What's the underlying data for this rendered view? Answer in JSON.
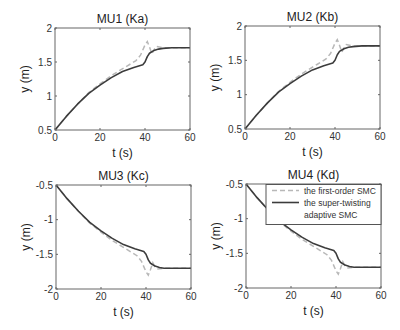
{
  "chart_data": [
    {
      "type": "line",
      "title": "MU1 (Ka)",
      "xlabel": "t (s)",
      "ylabel": "y (m)",
      "xlim": [
        0,
        60
      ],
      "ylim": [
        0.5,
        2
      ],
      "xticks": [
        0,
        20,
        40,
        60
      ],
      "xtick_labels": [
        "0",
        "20",
        "40",
        "60"
      ],
      "yticks": [
        0.5,
        1,
        1.5,
        2
      ],
      "ytick_labels": [
        "0.5",
        "1",
        "1.5",
        "2"
      ],
      "grid": false,
      "box": {
        "x0": 55,
        "y0": 28,
        "x1": 190,
        "y1": 130
      },
      "series": [
        {
          "name": "the first-order SMC",
          "style": "dashed",
          "x": [
            0,
            5,
            10,
            15,
            20,
            25,
            28,
            32,
            36,
            38,
            40,
            41,
            42,
            43,
            44,
            45,
            48,
            52,
            60
          ],
          "y": [
            0.5,
            0.7,
            0.88,
            1.05,
            1.18,
            1.3,
            1.36,
            1.44,
            1.52,
            1.6,
            1.75,
            1.8,
            1.72,
            1.62,
            1.68,
            1.73,
            1.71,
            1.71,
            1.71
          ]
        },
        {
          "name": "the super-twisting adaptive SMC",
          "style": "solid",
          "x": [
            0,
            5,
            10,
            15,
            20,
            25,
            30,
            35,
            39,
            40,
            41,
            42,
            44,
            46,
            48,
            52,
            60
          ],
          "y": [
            0.5,
            0.7,
            0.88,
            1.04,
            1.16,
            1.27,
            1.36,
            1.42,
            1.46,
            1.5,
            1.58,
            1.63,
            1.67,
            1.69,
            1.7,
            1.71,
            1.71
          ]
        }
      ]
    },
    {
      "type": "line",
      "title": "MU2 (Kb)",
      "xlabel": "t (s)",
      "ylabel": "y (m)",
      "xlim": [
        0,
        60
      ],
      "ylim": [
        0.5,
        2
      ],
      "xticks": [
        0,
        20,
        40,
        60
      ],
      "xtick_labels": [
        "0",
        "20",
        "40",
        "60"
      ],
      "yticks": [
        0.5,
        1,
        1.5,
        2
      ],
      "ytick_labels": [
        "0.5",
        "1",
        "1.5",
        "2"
      ],
      "grid": false,
      "box": {
        "x0": 245,
        "y0": 26,
        "x1": 380,
        "y1": 129
      },
      "series": [
        {
          "name": "the first-order SMC",
          "style": "dashed",
          "x": [
            0,
            5,
            10,
            15,
            20,
            25,
            28,
            32,
            36,
            38,
            40,
            41,
            42,
            43,
            44,
            45,
            48,
            52,
            60
          ],
          "y": [
            0.5,
            0.7,
            0.88,
            1.05,
            1.18,
            1.3,
            1.36,
            1.44,
            1.52,
            1.6,
            1.75,
            1.8,
            1.72,
            1.62,
            1.68,
            1.73,
            1.71,
            1.71,
            1.71
          ]
        },
        {
          "name": "the super-twisting adaptive SMC",
          "style": "solid",
          "x": [
            0,
            5,
            10,
            15,
            20,
            25,
            30,
            35,
            39,
            40,
            41,
            42,
            44,
            46,
            48,
            52,
            60
          ],
          "y": [
            0.5,
            0.7,
            0.88,
            1.04,
            1.16,
            1.27,
            1.36,
            1.42,
            1.46,
            1.5,
            1.58,
            1.63,
            1.67,
            1.69,
            1.7,
            1.71,
            1.71
          ]
        }
      ]
    },
    {
      "type": "line",
      "title": "MU3 (Kc)",
      "xlabel": "t (s)",
      "ylabel": "y (m)",
      "xlim": [
        0,
        60
      ],
      "ylim": [
        -2,
        -0.5
      ],
      "xticks": [
        0,
        20,
        40,
        60
      ],
      "xtick_labels": [
        "0",
        "20",
        "40",
        "60"
      ],
      "yticks": [
        -2,
        -1.5,
        -1,
        -0.5
      ],
      "ytick_labels": [
        "-2",
        "-1.5",
        "-1",
        "-0.5"
      ],
      "grid": false,
      "box": {
        "x0": 56,
        "y0": 185,
        "x1": 191,
        "y1": 289
      },
      "series": [
        {
          "name": "the first-order SMC",
          "style": "dashed",
          "x": [
            0,
            5,
            10,
            15,
            20,
            25,
            28,
            32,
            36,
            38,
            40,
            41,
            42,
            43,
            44,
            45,
            48,
            52,
            60
          ],
          "y": [
            -0.5,
            -0.7,
            -0.88,
            -1.05,
            -1.18,
            -1.3,
            -1.36,
            -1.44,
            -1.52,
            -1.6,
            -1.75,
            -1.8,
            -1.72,
            -1.62,
            -1.68,
            -1.71,
            -1.7,
            -1.7,
            -1.7
          ]
        },
        {
          "name": "the super-twisting adaptive SMC",
          "style": "solid",
          "x": [
            0,
            5,
            10,
            15,
            20,
            25,
            30,
            35,
            39,
            40,
            41,
            42,
            44,
            46,
            48,
            52,
            60
          ],
          "y": [
            -0.5,
            -0.7,
            -0.88,
            -1.04,
            -1.16,
            -1.27,
            -1.36,
            -1.42,
            -1.46,
            -1.5,
            -1.58,
            -1.63,
            -1.67,
            -1.69,
            -1.7,
            -1.7,
            -1.7
          ]
        }
      ]
    },
    {
      "type": "line",
      "title": "MU4 (Kd)",
      "xlabel": "t (s)",
      "ylabel": "y (m)",
      "xlim": [
        0,
        60
      ],
      "ylim": [
        -2,
        -0.5
      ],
      "xticks": [
        0,
        20,
        40,
        60
      ],
      "xtick_labels": [
        "0",
        "20",
        "40",
        "60"
      ],
      "yticks": [
        -2,
        -1.5,
        -1,
        -0.5
      ],
      "ytick_labels": [
        "-2",
        "-1.5",
        "-1",
        "-0.5"
      ],
      "grid": false,
      "box": {
        "x0": 246,
        "y0": 184,
        "x1": 381,
        "y1": 288
      },
      "legend": {
        "position": "upper right",
        "entries": [
          {
            "label_lines": [
              "the first-order SMC"
            ],
            "style": "dashed"
          },
          {
            "label_lines": [
              "the super-twisting",
              "adaptive SMC"
            ],
            "style": "solid"
          }
        ]
      },
      "series": [
        {
          "name": "the first-order SMC",
          "style": "dashed",
          "x": [
            0,
            5,
            10,
            15,
            20,
            25,
            28,
            32,
            36,
            38,
            40,
            41,
            42,
            43,
            44,
            45,
            48,
            52,
            60
          ],
          "y": [
            -0.5,
            -0.7,
            -0.88,
            -1.05,
            -1.18,
            -1.3,
            -1.36,
            -1.44,
            -1.52,
            -1.6,
            -1.75,
            -1.8,
            -1.72,
            -1.62,
            -1.68,
            -1.71,
            -1.7,
            -1.7,
            -1.7
          ]
        },
        {
          "name": "the super-twisting adaptive SMC",
          "style": "solid",
          "x": [
            0,
            5,
            10,
            15,
            20,
            25,
            30,
            35,
            39,
            40,
            41,
            42,
            44,
            46,
            48,
            52,
            60
          ],
          "y": [
            -0.5,
            -0.7,
            -0.88,
            -1.04,
            -1.16,
            -1.27,
            -1.36,
            -1.42,
            -1.46,
            -1.5,
            -1.58,
            -1.63,
            -1.67,
            -1.69,
            -1.7,
            -1.7,
            -1.7
          ]
        }
      ]
    }
  ],
  "colors": {
    "solid_line": "#3c3c3c",
    "dashed_line": "#b8b8b8",
    "axes": "#666666"
  }
}
